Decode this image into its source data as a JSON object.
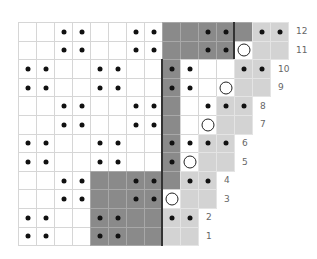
{
  "chart": {
    "title": "",
    "grid": {
      "left": 18,
      "top": 22,
      "cell_w": 18,
      "cell_h": 18.6,
      "rows": 12
    },
    "colors": {
      "white": "#ffffff",
      "dark": "#8a8a8a",
      "light": "#d3d3d3",
      "dot": "#111111",
      "line": "#333333"
    },
    "legend_key": {
      "W": "white",
      "D": "dark",
      "L": "light",
      ".": "dot",
      "o": "ring",
      "_": "blank"
    },
    "rows": [
      {
        "label": "12",
        "thick_col": 12,
        "cells": [
          "W_",
          "W_",
          "W.",
          "W.",
          "W_",
          "W_",
          "W.",
          "W.",
          "D_",
          "D_",
          "D.",
          "D.",
          "D_",
          "L.",
          "L."
        ]
      },
      {
        "label": "11",
        "thick_col": 12,
        "cells": [
          "W_",
          "W_",
          "W.",
          "W.",
          "W_",
          "W_",
          "W.",
          "W.",
          "D_",
          "D_",
          "D.",
          "D.",
          "Wo",
          "L_",
          "L_"
        ]
      },
      {
        "label": "10",
        "thick_col": 8,
        "cells": [
          "W.",
          "W.",
          "W_",
          "W_",
          "W.",
          "W.",
          "W_",
          "W_",
          "D.",
          "W.",
          "W_",
          "W_",
          "L.",
          "L."
        ]
      },
      {
        "label": "9",
        "thick_col": 8,
        "cells": [
          "W.",
          "W.",
          "W_",
          "W_",
          "W.",
          "W.",
          "W_",
          "W_",
          "D.",
          "W.",
          "W_",
          "Wo",
          "L_",
          "L_"
        ]
      },
      {
        "label": "8",
        "thick_col": 8,
        "cells": [
          "W_",
          "W_",
          "W.",
          "W.",
          "W_",
          "W_",
          "W.",
          "W.",
          "D_",
          "W_",
          "W.",
          "L.",
          "L."
        ]
      },
      {
        "label": "7",
        "thick_col": 8,
        "cells": [
          "W_",
          "W_",
          "W.",
          "W.",
          "W_",
          "W_",
          "W.",
          "W.",
          "D_",
          "W_",
          "Wo",
          "L_",
          "L_"
        ]
      },
      {
        "label": "6",
        "thick_col": 8,
        "cells": [
          "W.",
          "W.",
          "W_",
          "W_",
          "W.",
          "W.",
          "W_",
          "W_",
          "D.",
          "W.",
          "L.",
          "L."
        ]
      },
      {
        "label": "5",
        "thick_col": 8,
        "cells": [
          "W.",
          "W.",
          "W_",
          "W_",
          "W.",
          "W.",
          "W_",
          "W_",
          "D.",
          "Wo",
          "L_",
          "L_"
        ]
      },
      {
        "label": "4",
        "thick_col": 8,
        "cells": [
          "W_",
          "W_",
          "W.",
          "W.",
          "D_",
          "D_",
          "D.",
          "D.",
          "D_",
          "L.",
          "L."
        ]
      },
      {
        "label": "3",
        "thick_col": 8,
        "cells": [
          "W_",
          "W_",
          "W.",
          "W.",
          "D_",
          "D_",
          "D.",
          "D.",
          "Wo",
          "L_",
          "L_"
        ]
      },
      {
        "label": "2",
        "thick_col": 8,
        "cells": [
          "W.",
          "W.",
          "W_",
          "W_",
          "D.",
          "D.",
          "D_",
          "D_",
          "L.",
          "L."
        ]
      },
      {
        "label": "1",
        "thick_col": 8,
        "cells": [
          "W.",
          "W.",
          "W_",
          "W_",
          "D.",
          "D.",
          "D_",
          "D_",
          "L_",
          "L_"
        ]
      }
    ]
  }
}
